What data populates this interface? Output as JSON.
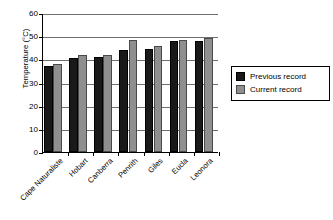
{
  "chart_data": {
    "type": "bar",
    "title": "",
    "xlabel": "",
    "ylabel": "Temperature (°C)",
    "ylim": [
      0,
      60
    ],
    "yticks": [
      0,
      10,
      20,
      30,
      40,
      50,
      60
    ],
    "grid": true,
    "legend_position": "right",
    "categories": [
      "Cape Naturaliste",
      "Hobart",
      "Canberra",
      "Penrith",
      "Giles",
      "Eucla",
      "Leonora"
    ],
    "series": [
      {
        "name": "Previous record",
        "color": "#191919",
        "values": [
          37.3,
          40.6,
          41.2,
          44.0,
          44.3,
          47.8,
          47.8
        ]
      },
      {
        "name": "Current record",
        "color": "#8f8f8f",
        "values": [
          37.8,
          41.7,
          41.8,
          48.4,
          45.7,
          48.4,
          49.2
        ]
      }
    ]
  },
  "legend": {
    "items": [
      {
        "label": "Previous record",
        "swatch": "previous"
      },
      {
        "label": "Current record",
        "swatch": "current"
      }
    ]
  }
}
